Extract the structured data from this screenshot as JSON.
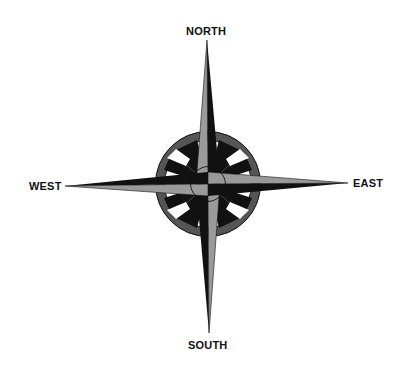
{
  "diagram": {
    "type": "compass-rose",
    "labels": {
      "north": "NORTH",
      "south": "SOUTH",
      "east": "EAST",
      "west": "WEST"
    },
    "colors": {
      "dark": "#111111",
      "light": "#9a9a9a",
      "ring": "#555555",
      "background": "#ffffff"
    }
  }
}
